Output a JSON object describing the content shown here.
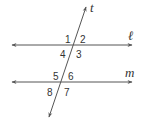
{
  "diagram": {
    "colors": {
      "line": "#555555",
      "text": "#333333",
      "background": "#ffffff"
    },
    "lines": [
      {
        "id": "l",
        "label": "ℓ",
        "type": "parallel",
        "x1": 12,
        "y1": 45,
        "x2": 132,
        "y2": 45,
        "label_x": 128,
        "label_y": 40
      },
      {
        "id": "m",
        "label": "m",
        "type": "parallel",
        "x1": 12,
        "y1": 82,
        "x2": 132,
        "y2": 82,
        "label_x": 126,
        "label_y": 77
      },
      {
        "id": "t",
        "label": "t",
        "type": "transversal",
        "x1": 49,
        "y1": 117,
        "x2": 86,
        "y2": 7,
        "label_x": 90,
        "label_y": 12
      }
    ],
    "angles": [
      {
        "label": "1",
        "x": 66,
        "y": 43
      },
      {
        "label": "2",
        "x": 81,
        "y": 43
      },
      {
        "label": "3",
        "x": 76,
        "y": 58
      },
      {
        "label": "4",
        "x": 61,
        "y": 58
      },
      {
        "label": "5",
        "x": 53,
        "y": 80
      },
      {
        "label": "6",
        "x": 69,
        "y": 80
      },
      {
        "label": "7",
        "x": 65,
        "y": 96
      },
      {
        "label": "8",
        "x": 48,
        "y": 96
      }
    ]
  }
}
